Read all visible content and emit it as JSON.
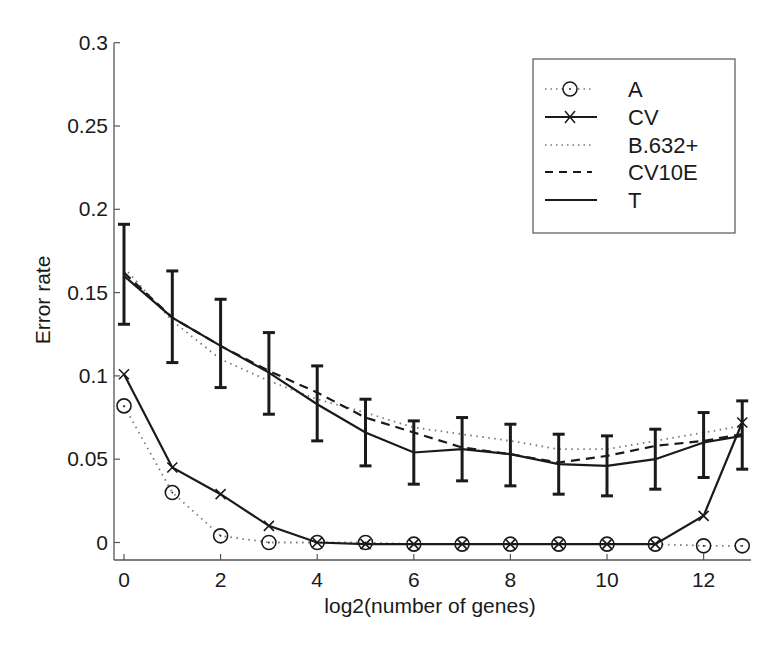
{
  "chart_data": {
    "type": "line",
    "title": "",
    "xlabel": "log2(number of genes)",
    "ylabel": "Error rate",
    "xlim": [
      -0.2,
      13.05
    ],
    "ylim": [
      -0.011,
      0.3
    ],
    "xticks": [
      0,
      2,
      4,
      6,
      8,
      10,
      12
    ],
    "xtick_labels": [
      "0",
      "2",
      "4",
      "6",
      "8",
      "10",
      "12"
    ],
    "yticks": [
      0,
      0.05,
      0.1,
      0.15,
      0.2,
      0.25,
      0.3
    ],
    "ytick_labels": [
      "0",
      "0.05",
      "0.1",
      "0.15",
      "0.2",
      "0.25",
      "0.3"
    ],
    "grid": false,
    "legend_position": "upper right",
    "x": [
      0,
      1,
      2,
      3,
      4,
      5,
      6,
      7,
      8,
      9,
      10,
      11,
      12,
      12.8
    ],
    "series": [
      {
        "name": "A",
        "style": "dotted",
        "marker": "circle",
        "values": [
          0.082,
          0.03,
          0.004,
          0.0,
          0.0,
          0.0,
          -0.001,
          -0.001,
          -0.001,
          -0.001,
          -0.001,
          -0.001,
          -0.002,
          -0.002
        ]
      },
      {
        "name": "CV",
        "style": "solid",
        "marker": "x",
        "values": [
          0.101,
          0.045,
          0.029,
          0.01,
          0.0,
          -0.001,
          -0.001,
          -0.001,
          -0.001,
          -0.001,
          -0.001,
          -0.001,
          0.016,
          0.072
        ]
      },
      {
        "name": "B.632+",
        "style": "dotted",
        "marker": "none",
        "values": [
          0.165,
          0.133,
          0.11,
          0.097,
          0.086,
          0.078,
          0.069,
          0.065,
          0.061,
          0.056,
          0.056,
          0.061,
          0.066,
          0.07
        ]
      },
      {
        "name": "CV10E",
        "style": "dashed",
        "marker": "none",
        "values": [
          0.162,
          0.135,
          0.118,
          0.103,
          0.09,
          0.075,
          0.066,
          0.057,
          0.053,
          0.048,
          0.052,
          0.058,
          0.061,
          0.065
        ]
      },
      {
        "name": "T",
        "style": "solid",
        "marker": "none",
        "values": [
          0.16,
          0.135,
          0.118,
          0.102,
          0.083,
          0.066,
          0.054,
          0.056,
          0.053,
          0.047,
          0.046,
          0.05,
          0.06,
          0.064
        ],
        "error_low": [
          0.131,
          0.108,
          0.093,
          0.077,
          0.061,
          0.046,
          0.035,
          0.037,
          0.034,
          0.029,
          0.028,
          0.032,
          0.039,
          0.044
        ],
        "error_high": [
          0.191,
          0.163,
          0.146,
          0.126,
          0.106,
          0.086,
          0.073,
          0.075,
          0.071,
          0.065,
          0.064,
          0.068,
          0.078,
          0.085
        ]
      }
    ]
  },
  "legend": {
    "items": [
      {
        "label": "A"
      },
      {
        "label": "CV"
      },
      {
        "label": "B.632+"
      },
      {
        "label": "CV10E"
      },
      {
        "label": "T"
      }
    ]
  },
  "axes": {
    "xlabel": "log2(number of genes)",
    "ylabel": "Error rate"
  },
  "colors": {
    "line": "#1a1a1a",
    "axis": "#555555",
    "dotted": "#777777",
    "background": "#ffffff"
  }
}
